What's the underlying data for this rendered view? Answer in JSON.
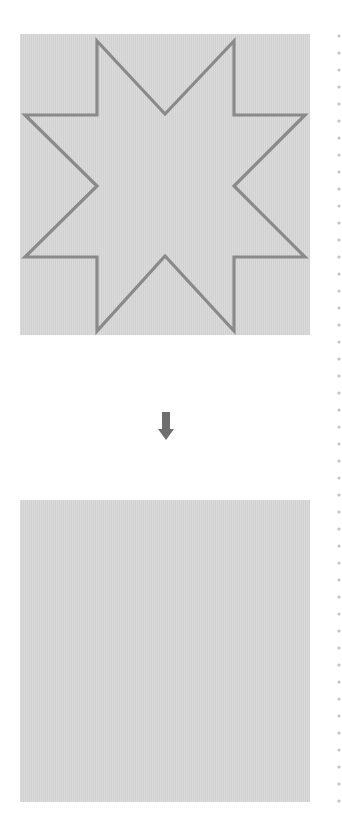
{
  "diagram": {
    "top_panel": {
      "shape": "eight-pointed-star",
      "fill_color": "#d7d7d7",
      "stroke_color": "#8a8a8a"
    },
    "arrow": {
      "direction": "down",
      "color": "#6e6e6e"
    },
    "bottom_panel": {
      "shape": "square",
      "fill_color": "#d7d7d7"
    },
    "divider": {
      "style": "dotted",
      "color": "#c4c4c4"
    }
  }
}
